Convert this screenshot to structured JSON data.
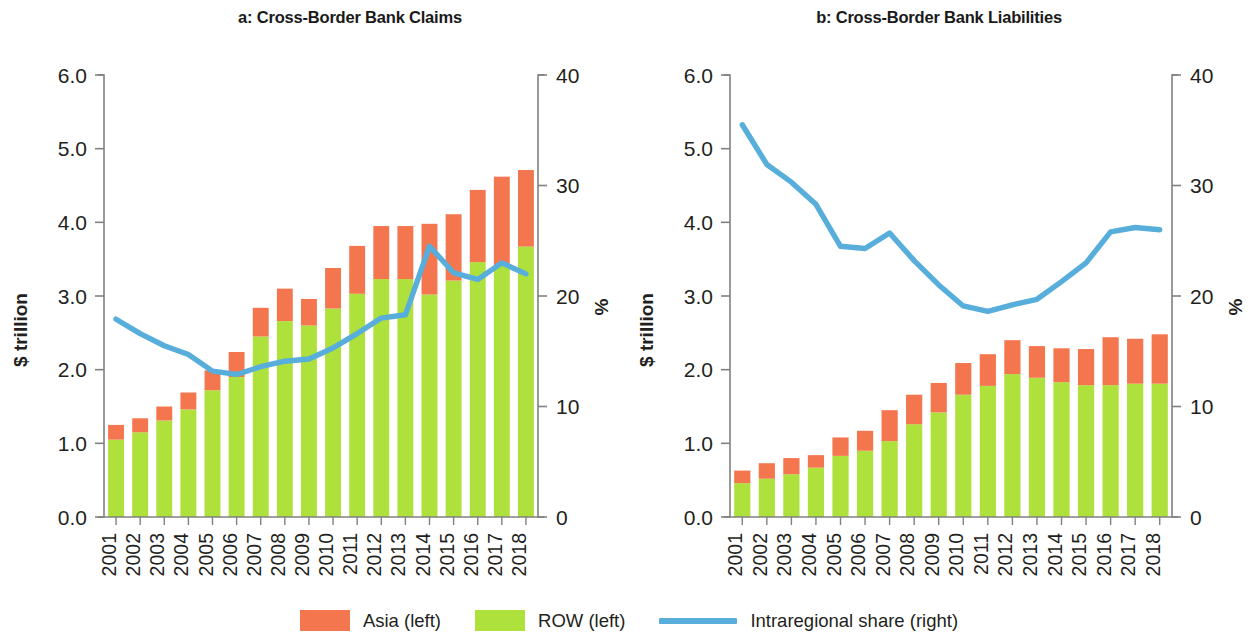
{
  "figure": {
    "background": "#ffffff",
    "colors": {
      "asia": "#F4764F",
      "row": "#AFE13C",
      "line": "#57AEDB",
      "axis": "#808080",
      "text": "#231f20"
    }
  },
  "legend": {
    "items": [
      {
        "label": "Asia (left)",
        "marker": "swatch",
        "color": "#F4764F",
        "name": "legend-asia"
      },
      {
        "label": "ROW (left)",
        "marker": "swatch",
        "color": "#AFE13C",
        "name": "legend-row"
      },
      {
        "label": "Intraregional share (right)",
        "marker": "line",
        "color": "#57AEDB",
        "name": "legend-intraregional-share"
      }
    ]
  },
  "chart_data": [
    {
      "type": "bar",
      "panel": "a",
      "title": "a: Cross-Border Bank Claims",
      "xlabel": "",
      "ylabel": "$ trillion",
      "y2label": "%",
      "categories": [
        "2001",
        "2002",
        "2003",
        "2004",
        "2005",
        "2006",
        "2007",
        "2008",
        "2009",
        "2010",
        "2011",
        "2012",
        "2013",
        "2014",
        "2015",
        "2016",
        "2017",
        "2018"
      ],
      "ylim": [
        0,
        6
      ],
      "yticks": [
        "0.0",
        "1.0",
        "2.0",
        "3.0",
        "4.0",
        "5.0",
        "6.0"
      ],
      "y2lim": [
        0,
        40
      ],
      "y2ticks": [
        "0",
        "10",
        "20",
        "30",
        "40"
      ],
      "grid": false,
      "legend_position": "bottom",
      "stacked": true,
      "series": [
        {
          "name": "ROW (left)",
          "axis": "left",
          "color": "#AFE13C",
          "values": [
            1.05,
            1.15,
            1.31,
            1.46,
            1.72,
            1.9,
            2.45,
            2.66,
            2.6,
            2.83,
            3.03,
            3.23,
            3.23,
            3.02,
            3.21,
            3.46,
            3.42,
            3.67
          ]
        },
        {
          "name": "Asia (left)",
          "axis": "left",
          "color": "#F4764F",
          "values": [
            0.2,
            0.19,
            0.19,
            0.23,
            0.27,
            0.34,
            0.39,
            0.44,
            0.36,
            0.55,
            0.65,
            0.72,
            0.72,
            0.96,
            0.9,
            0.98,
            1.2,
            1.04
          ]
        },
        {
          "name": "Intraregional share (right)",
          "axis": "right",
          "color": "#57AEDB",
          "type": "line",
          "values": [
            17.9,
            16.6,
            15.5,
            14.7,
            13.2,
            12.9,
            13.6,
            14.1,
            14.3,
            15.3,
            16.6,
            18.0,
            18.3,
            24.5,
            22.1,
            21.5,
            23.0,
            22.0
          ]
        }
      ]
    },
    {
      "type": "bar",
      "panel": "b",
      "title": "b: Cross-Border Bank Liabilities",
      "xlabel": "",
      "ylabel": "$ trillion",
      "y2label": "%",
      "categories": [
        "2001",
        "2002",
        "2003",
        "2004",
        "2005",
        "2006",
        "2007",
        "2008",
        "2009",
        "2010",
        "2011",
        "2012",
        "2013",
        "2014",
        "2015",
        "2016",
        "2017",
        "2018"
      ],
      "ylim": [
        0,
        6
      ],
      "yticks": [
        "0.0",
        "1.0",
        "2.0",
        "3.0",
        "4.0",
        "5.0",
        "6.0"
      ],
      "y2lim": [
        0,
        40
      ],
      "y2ticks": [
        "0",
        "10",
        "20",
        "30",
        "40"
      ],
      "grid": false,
      "legend_position": "bottom",
      "stacked": true,
      "series": [
        {
          "name": "ROW (left)",
          "axis": "left",
          "color": "#AFE13C",
          "values": [
            0.46,
            0.52,
            0.58,
            0.67,
            0.83,
            0.9,
            1.03,
            1.26,
            1.42,
            1.66,
            1.78,
            1.94,
            1.89,
            1.83,
            1.79,
            1.79,
            1.81,
            1.81
          ]
        },
        {
          "name": "Asia (left)",
          "axis": "left",
          "color": "#F4764F",
          "values": [
            0.17,
            0.21,
            0.22,
            0.17,
            0.25,
            0.27,
            0.42,
            0.4,
            0.4,
            0.43,
            0.43,
            0.46,
            0.43,
            0.46,
            0.49,
            0.65,
            0.61,
            0.67
          ]
        },
        {
          "name": "Intraregional share (right)",
          "axis": "right",
          "color": "#57AEDB",
          "type": "line",
          "values": [
            35.5,
            31.9,
            30.3,
            28.3,
            24.5,
            24.3,
            25.7,
            23.2,
            21.0,
            19.1,
            18.6,
            19.2,
            19.7,
            21.3,
            23.0,
            25.8,
            26.2,
            26.0
          ]
        }
      ]
    }
  ]
}
